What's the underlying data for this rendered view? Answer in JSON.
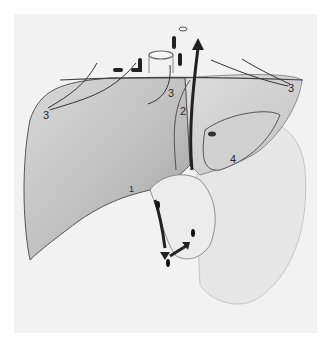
{
  "figure": {
    "labels": [
      {
        "id": "label-3-left",
        "text": "3",
        "x": 43,
        "y": 110
      },
      {
        "id": "label-3-center",
        "text": "3",
        "x": 168,
        "y": 88
      },
      {
        "id": "label-3-right",
        "text": "3",
        "x": 288,
        "y": 83
      },
      {
        "id": "label-2",
        "text": "2",
        "x": 180,
        "y": 106
      },
      {
        "id": "label-1",
        "text": "1",
        "x": 129,
        "y": 185
      },
      {
        "id": "label-4",
        "text": "4",
        "x": 230,
        "y": 154
      }
    ],
    "colors": {
      "background": "#ffffff",
      "panel": "#f2f2f2",
      "ink": "#2a2a2a",
      "shade": "#8a8a8a"
    }
  }
}
